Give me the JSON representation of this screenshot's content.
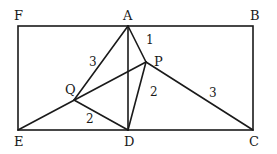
{
  "diagram": {
    "type": "geometry",
    "points": {
      "F": {
        "label": "F",
        "x": 18,
        "y": 26
      },
      "A": {
        "label": "A",
        "x": 128,
        "y": 26
      },
      "B": {
        "label": "B",
        "x": 253,
        "y": 26
      },
      "E": {
        "label": "E",
        "x": 18,
        "y": 130
      },
      "D": {
        "label": "D",
        "x": 128,
        "y": 130
      },
      "C": {
        "label": "C",
        "x": 253,
        "y": 130
      },
      "P": {
        "label": "P",
        "x": 146,
        "y": 62
      },
      "Q": {
        "label": "Q",
        "x": 74,
        "y": 100
      }
    },
    "segment_lengths": {
      "AQ": "3",
      "AP": "1",
      "PD": "2",
      "PC": "3",
      "QD": "2"
    },
    "colors": {
      "stroke": "#1a1a1a",
      "background": "#ffffff"
    }
  }
}
